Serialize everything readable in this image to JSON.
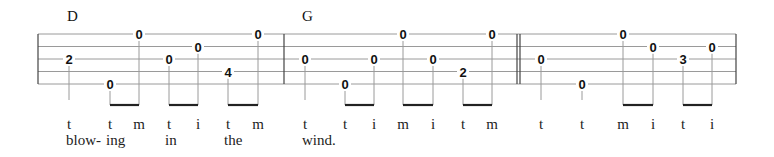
{
  "tablature": {
    "strings": 5,
    "string_y": [
      34,
      46.5,
      59,
      71.5,
      84
    ],
    "staff_x": [
      38,
      736
    ],
    "barlines": [
      {
        "x": 38,
        "type": "single"
      },
      {
        "x": 284,
        "type": "single"
      },
      {
        "x": 517,
        "type": "double"
      },
      {
        "x": 736,
        "type": "single"
      }
    ],
    "measures": [
      {
        "chord": "D",
        "chord_x": 67,
        "notes": [
          {
            "x": 69,
            "string": 3,
            "fret": "2",
            "finger": "t",
            "stem": "single"
          },
          {
            "x": 110,
            "string": 5,
            "fret": "0",
            "finger": "t",
            "stem": "beam-start"
          },
          {
            "x": 139,
            "string": 1,
            "fret": "0",
            "finger": "m",
            "stem": "beam-end"
          },
          {
            "x": 169,
            "string": 3,
            "fret": "0",
            "finger": "t",
            "stem": "beam-start"
          },
          {
            "x": 198,
            "string": 2,
            "fret": "0",
            "finger": "i",
            "stem": "beam-end"
          },
          {
            "x": 228,
            "string": 4,
            "fret": "4",
            "finger": "t",
            "stem": "beam-start"
          },
          {
            "x": 258,
            "string": 1,
            "fret": "0",
            "finger": "m",
            "stem": "beam-end"
          }
        ],
        "lyrics": [
          {
            "x": 66,
            "text": "blow-"
          },
          {
            "x": 106,
            "text": "ing"
          },
          {
            "x": 165,
            "text": "in"
          },
          {
            "x": 224,
            "text": "the"
          }
        ]
      },
      {
        "chord": "G",
        "chord_x": 302,
        "notes": [
          {
            "x": 305,
            "string": 3,
            "fret": "0",
            "finger": "t",
            "stem": "single"
          },
          {
            "x": 345,
            "string": 5,
            "fret": "0",
            "finger": "t",
            "stem": "beam-start"
          },
          {
            "x": 374,
            "string": 3,
            "fret": "0",
            "finger": "i",
            "stem": "beam-end"
          },
          {
            "x": 403,
            "string": 1,
            "fret": "0",
            "finger": "m",
            "stem": "beam-start"
          },
          {
            "x": 433,
            "string": 3,
            "fret": "0",
            "finger": "i",
            "stem": "beam-end"
          },
          {
            "x": 463,
            "string": 4,
            "fret": "2",
            "finger": "t",
            "stem": "beam-start"
          },
          {
            "x": 492,
            "string": 1,
            "fret": "0",
            "finger": "m",
            "stem": "beam-end"
          }
        ],
        "lyrics": [
          {
            "x": 302,
            "text": "wind."
          }
        ]
      },
      {
        "chord": "",
        "chord_x": 0,
        "notes": [
          {
            "x": 541,
            "string": 3,
            "fret": "0",
            "finger": "t",
            "stem": "single"
          },
          {
            "x": 582,
            "string": 5,
            "fret": "0",
            "finger": "t",
            "stem": "single"
          },
          {
            "x": 623,
            "string": 1,
            "fret": "0",
            "finger": "m",
            "stem": "beam-start"
          },
          {
            "x": 653,
            "string": 2,
            "fret": "0",
            "finger": "i",
            "stem": "beam-end"
          },
          {
            "x": 683,
            "string": 3,
            "fret": "3",
            "finger": "t",
            "stem": "beam-start"
          },
          {
            "x": 712,
            "string": 2,
            "fret": "0",
            "finger": "i",
            "stem": "beam-end"
          }
        ],
        "lyrics": []
      }
    ],
    "colors": {
      "staff_line": "#9a9a9a",
      "barline": "#444444",
      "stem": "#9a9a9a",
      "beam": "#222222",
      "text": "#111111"
    }
  }
}
